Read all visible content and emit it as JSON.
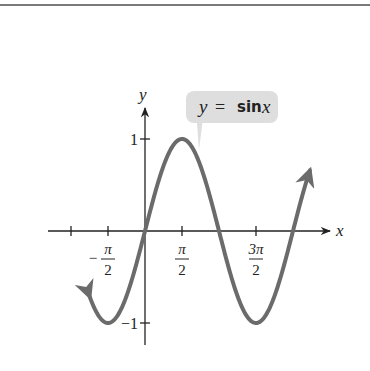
{
  "chart_data": {
    "type": "line",
    "title": "",
    "function": "y = sin x",
    "annotation": {
      "text_y": "y",
      "text_eq": "=",
      "text_fn": "sin",
      "text_x": "x"
    },
    "xlabel": "x",
    "ylabel": "y",
    "x_ticks": [
      {
        "value": -1.5708,
        "num": "π",
        "den": "2",
        "sign": "−"
      },
      {
        "value": 1.5708,
        "num": "π",
        "den": "2",
        "sign": ""
      },
      {
        "value": 4.7124,
        "num": "3π",
        "den": "2",
        "sign": ""
      }
    ],
    "y_ticks": [
      {
        "value": 1,
        "label": "1"
      },
      {
        "value": -1,
        "label": "−1"
      }
    ],
    "xlim": [
      -2.6,
      6.0
    ],
    "ylim": [
      -1.2,
      1.5
    ],
    "x": [
      -2.35,
      -1.5708,
      0,
      1.5708,
      3.1416,
      4.7124,
      6.2832,
      7.0
    ],
    "y": [
      -0.71,
      -1,
      0,
      1,
      0,
      -1,
      0,
      0.66
    ],
    "grid": false,
    "legend": "none",
    "colors": {
      "curve": "#6b6b6b",
      "axis": "#222222",
      "callout": "#dedede"
    }
  }
}
